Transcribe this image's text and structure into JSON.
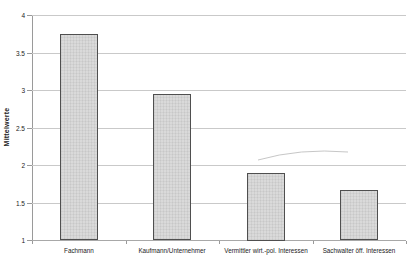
{
  "chart_data": {
    "type": "bar",
    "title": "",
    "xlabel": "",
    "ylabel": "Mittelwerte",
    "categories": [
      "Fachmann",
      "Kaufmann/Unternehmer",
      "Vermittler wirt.-pol. Interessen",
      "Sachwalter öff. Interessen"
    ],
    "values": [
      3.75,
      2.95,
      1.9,
      1.67
    ],
    "ylim": [
      1,
      4
    ],
    "ytick_step": 0.5,
    "ytick_labels": [
      "4",
      "3.5",
      "3",
      "2.5",
      "2",
      "1.5",
      "1"
    ],
    "grid": true,
    "legend_position": "none",
    "colors": {
      "bar_fill": "#d6d6d6",
      "bar_border": "#4f4f4f",
      "gridline": "#c9c9c9",
      "axis": "#9a9a9a",
      "text": "#222222",
      "background": "#ffffff"
    }
  }
}
